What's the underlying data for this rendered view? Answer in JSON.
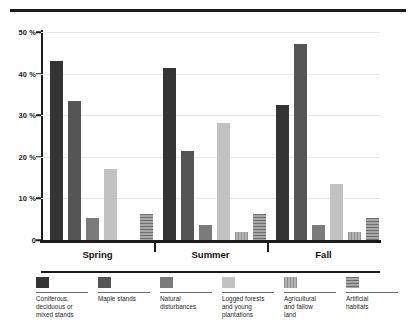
{
  "chart_data": {
    "type": "bar",
    "title": "",
    "subtitle": "",
    "xlabel": "",
    "ylabel": "",
    "ylim": [
      0,
      50
    ],
    "grid": true,
    "legend_position": "bottom",
    "categories": [
      "Spring",
      "Summer",
      "Fall"
    ],
    "y_ticks": [
      {
        "value": 0,
        "label": "0"
      },
      {
        "value": 10,
        "label": "10 %"
      },
      {
        "value": 20,
        "label": "20 %"
      },
      {
        "value": 30,
        "label": "30 %"
      },
      {
        "value": 40,
        "label": "40 %"
      },
      {
        "value": 50,
        "label": "50 %"
      }
    ],
    "series": [
      {
        "name": "Coniferous, deciduous or mixed stands",
        "legend_label": "Coniferous,\ndeciduous or\nmixed stands",
        "color": "#343434",
        "pattern": "solid",
        "values": [
          43.0,
          41.3,
          32.5
        ]
      },
      {
        "name": "Maple stands",
        "legend_label": "Maple stands",
        "color": "#555555",
        "pattern": "solid",
        "values": [
          33.3,
          21.5,
          47.2
        ]
      },
      {
        "name": "Natural disturbances",
        "legend_label": "Natural\ndisturbances",
        "color": "#7b7b7b",
        "pattern": "solid",
        "values": [
          5.2,
          3.6,
          3.6
        ]
      },
      {
        "name": "Logged forests and young plantations",
        "legend_label": "Logged forests\nand young\nplantations",
        "color": "#c2c2c2",
        "pattern": "solid",
        "values": [
          17.0,
          28.2,
          13.5
        ]
      },
      {
        "name": "Agricultural and fallow land",
        "legend_label": "Agricultural\nand fallow\nland",
        "color": "#b3b3b3",
        "pattern": "vertical-lines",
        "values": [
          0.0,
          1.9,
          1.9
        ]
      },
      {
        "name": "Artificial habitats",
        "legend_label": "Artificial\nhabitats",
        "color": "#a8a8a8",
        "pattern": "horizontal-lines",
        "values": [
          6.3,
          6.3,
          5.2
        ]
      }
    ]
  }
}
